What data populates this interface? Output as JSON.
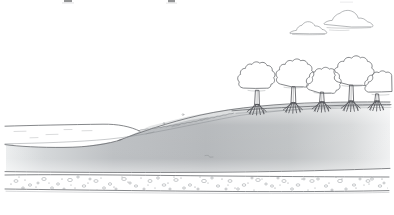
{
  "figure": {
    "style": "hand-drawn pen and ink line illustration",
    "width": 394,
    "height": 215,
    "background_color": "#ffffff"
  },
  "colors": {
    "ink": "#6f7175",
    "ink_fine": "#85888c",
    "ink_dark": "#4f5155",
    "sediment_dark": "#b9bcbe",
    "sediment_mid": "#c9cbcd",
    "sediment_light": "#e2e4e5",
    "upper_bank": "#d8dadb",
    "gravel_stroke": "#9a9da1",
    "water_fill": "#ffffff",
    "sky": "#ffffff"
  },
  "sky": {
    "label": "sky",
    "clouds": [
      {
        "name": "cloud-left",
        "cx": 308,
        "cy": 28,
        "width": 36,
        "height": 13
      },
      {
        "name": "cloud-right",
        "cx": 347,
        "cy": 18,
        "width": 44,
        "height": 15
      }
    ]
  },
  "vegetation": {
    "label": "mangrove stand",
    "tree_count": 5,
    "trees": [
      {
        "name": "mangrove-tree-1",
        "trunk_x": 259,
        "ground_y": 110,
        "canopy_cx": 257,
        "canopy_cy": 78,
        "canopy_rx": 18,
        "canopy_ry": 16,
        "root_count": 7
      },
      {
        "name": "mangrove-tree-2",
        "trunk_x": 295,
        "ground_y": 108,
        "canopy_cx": 294,
        "canopy_cy": 72,
        "canopy_rx": 17,
        "canopy_ry": 17,
        "root_count": 7
      },
      {
        "name": "mangrove-tree-3",
        "trunk_x": 323,
        "ground_y": 107,
        "canopy_cx": 322,
        "canopy_cy": 80,
        "canopy_rx": 16,
        "canopy_ry": 14,
        "root_count": 7
      },
      {
        "name": "mangrove-tree-4",
        "trunk_x": 352,
        "ground_y": 106,
        "canopy_cx": 353,
        "canopy_cy": 70,
        "canopy_rx": 18,
        "canopy_ry": 18,
        "root_count": 7
      },
      {
        "name": "mangrove-tree-5",
        "trunk_x": 378,
        "ground_y": 105,
        "canopy_cx": 380,
        "canopy_cy": 82,
        "canopy_rx": 15,
        "canopy_ry": 13,
        "root_count": 6
      }
    ],
    "shoreline_scrub": {
      "name": "low-shoreline-vegetation",
      "description": "scalloped low scrub along the sloping upper bank",
      "start_x": 138,
      "end_x": 250
    }
  },
  "terrain": {
    "water_body": {
      "name": "water-body",
      "label": "open water at left",
      "surface_y": 125,
      "extent_x": [
        0,
        118
      ],
      "fill": "#ffffff",
      "ripple_marks": 5
    },
    "bank_slope": {
      "name": "sloping-bank",
      "label": "shoreline slope rising left to right",
      "top_left_y": 140,
      "top_right_y": 104
    },
    "sediment_wedge": {
      "name": "sediment-wedge",
      "label": "subsurface sediment layer with tonal gradient",
      "top_y_left": 134,
      "top_y_right": 106,
      "bottom_y": 172,
      "gradient": "light at left and right edges, darker through the centre"
    },
    "gravel_layer": {
      "name": "gravel-bedrock-layer",
      "label": "stippled gravel and cobble bed",
      "top_y": 174,
      "bottom_y": 192,
      "pattern": "speckled circles, ovals and dots"
    }
  },
  "annotations": {
    "top_edge_artifact": "faint cropped descenders of a caption line above the image frame"
  }
}
